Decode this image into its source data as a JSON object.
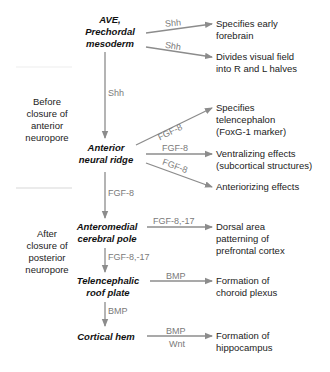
{
  "colors": {
    "arrow": "#8c8c8c",
    "signal_text": "#7a7a7a",
    "node_text": "#111111",
    "divider": "#e6e6e6"
  },
  "side_labels": {
    "before": [
      "Before",
      "closure of",
      "anterior",
      "neuropore"
    ],
    "after": [
      "After",
      "closure of",
      "posterior",
      "neuropore"
    ]
  },
  "nodes": {
    "ave": [
      "AVE,",
      "Prechordal",
      "mesoderm"
    ],
    "anr": [
      "Anterior",
      "neural ridge"
    ],
    "acp": [
      "Anteromedial",
      "cerebral pole"
    ],
    "trp": [
      "Telencephalic",
      "roof plate"
    ],
    "ch": [
      "Cortical hem"
    ]
  },
  "signals": {
    "ave_1": "Shh",
    "ave_2": "Shh",
    "ave_down": "Shh",
    "anr_1": "FGF-8",
    "anr_2": "FGF-8",
    "anr_3": "FGF-8",
    "anr_down": "FGF-8",
    "acp_1": "FGF-8,-17",
    "acp_down": "FGF-8,-17",
    "trp_1": "BMP",
    "trp_down": "BMP",
    "ch_1a": "BMP",
    "ch_1b": "Wnt"
  },
  "outcomes": {
    "ave_1": [
      "Specifies early",
      "forebrain"
    ],
    "ave_2": [
      "Divides visual field",
      "into R and L halves"
    ],
    "anr_1": [
      "Specifies",
      "telencephalon",
      "(FoxG-1 marker)"
    ],
    "anr_2": [
      "Ventralizing effects",
      "(subcortical structures)"
    ],
    "anr_3": [
      "Anteriorizing effects"
    ],
    "acp_1": [
      "Dorsal area",
      "patterning of",
      "prefrontal cortex"
    ],
    "trp_1": [
      "Formation of",
      "choroid plexus"
    ],
    "ch_1": [
      "Formation of",
      "hippocampus"
    ]
  }
}
